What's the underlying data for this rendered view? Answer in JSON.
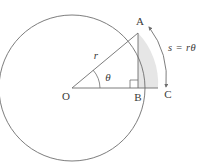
{
  "figure": {
    "background_color": "#ffffff",
    "stroke_color": "#6e6e6e",
    "text_color": "#3a3a3a",
    "sector_fill_color": "#e6e6e6",
    "labels": {
      "center_point": "O",
      "arc_point": "A",
      "foot_point": "B",
      "axis_point": "C",
      "radius": "r",
      "angle": "θ",
      "arc_equation": "s = rθ"
    },
    "geometry": {
      "center_x": 72,
      "center_y": 88,
      "radius": 73,
      "point_A_x": 138,
      "point_A_y": 33,
      "point_B_x": 138,
      "point_B_y": 88,
      "point_C_x": 158,
      "point_C_y": 88,
      "angle_degrees": 40
    }
  }
}
